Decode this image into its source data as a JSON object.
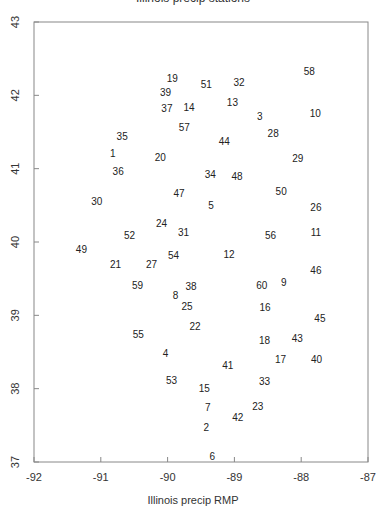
{
  "chart_data": {
    "type": "scatter",
    "title": "Illinois precip stations",
    "xlabel": "Illinois precip RMP",
    "ylabel": "",
    "xlim": [
      -92,
      -87
    ],
    "ylim": [
      37,
      43
    ],
    "xticks": [
      -92,
      -91,
      -90,
      -89,
      -88,
      -87
    ],
    "yticks": [
      37,
      38,
      39,
      40,
      41,
      42,
      43
    ],
    "grid": false,
    "marker": "text-labels",
    "points": [
      {
        "label": "58",
        "x": -87.88,
        "y": 42.33
      },
      {
        "label": "19",
        "x": -89.93,
        "y": 42.23
      },
      {
        "label": "51",
        "x": -89.42,
        "y": 42.15
      },
      {
        "label": "32",
        "x": -88.93,
        "y": 42.18
      },
      {
        "label": "39",
        "x": -90.03,
        "y": 42.05
      },
      {
        "label": "13",
        "x": -89.03,
        "y": 41.91
      },
      {
        "label": "37",
        "x": -90.01,
        "y": 41.83
      },
      {
        "label": "14",
        "x": -89.68,
        "y": 41.84
      },
      {
        "label": "3",
        "x": -88.62,
        "y": 41.72
      },
      {
        "label": "10",
        "x": -87.79,
        "y": 41.76
      },
      {
        "label": "57",
        "x": -89.75,
        "y": 41.57
      },
      {
        "label": "28",
        "x": -88.42,
        "y": 41.49
      },
      {
        "label": "35",
        "x": -90.68,
        "y": 41.44
      },
      {
        "label": "44",
        "x": -89.15,
        "y": 41.38
      },
      {
        "label": "1",
        "x": -90.82,
        "y": 41.21
      },
      {
        "label": "20",
        "x": -90.11,
        "y": 41.16
      },
      {
        "label": "29",
        "x": -88.05,
        "y": 41.15
      },
      {
        "label": "36",
        "x": -90.74,
        "y": 40.97
      },
      {
        "label": "34",
        "x": -89.36,
        "y": 40.93
      },
      {
        "label": "48",
        "x": -88.96,
        "y": 40.9
      },
      {
        "label": "47",
        "x": -89.83,
        "y": 40.67
      },
      {
        "label": "50",
        "x": -88.3,
        "y": 40.69
      },
      {
        "label": "30",
        "x": -91.06,
        "y": 40.56
      },
      {
        "label": "5",
        "x": -89.35,
        "y": 40.51
      },
      {
        "label": "26",
        "x": -87.78,
        "y": 40.48
      },
      {
        "label": "24",
        "x": -90.09,
        "y": 40.26
      },
      {
        "label": "31",
        "x": -89.76,
        "y": 40.14
      },
      {
        "label": "52",
        "x": -90.57,
        "y": 40.1
      },
      {
        "label": "56",
        "x": -88.46,
        "y": 40.1
      },
      {
        "label": "11",
        "x": -87.78,
        "y": 40.13
      },
      {
        "label": "49",
        "x": -91.29,
        "y": 39.91
      },
      {
        "label": "12",
        "x": -89.08,
        "y": 39.84
      },
      {
        "label": "54",
        "x": -89.91,
        "y": 39.82
      },
      {
        "label": "21",
        "x": -90.78,
        "y": 39.7
      },
      {
        "label": "27",
        "x": -90.24,
        "y": 39.7
      },
      {
        "label": "46",
        "x": -87.78,
        "y": 39.62
      },
      {
        "label": "59",
        "x": -90.45,
        "y": 39.42
      },
      {
        "label": "60",
        "x": -88.59,
        "y": 39.41
      },
      {
        "label": "9",
        "x": -88.26,
        "y": 39.46
      },
      {
        "label": "38",
        "x": -89.65,
        "y": 39.4
      },
      {
        "label": "8",
        "x": -89.88,
        "y": 39.28
      },
      {
        "label": "25",
        "x": -89.71,
        "y": 39.13
      },
      {
        "label": "16",
        "x": -88.54,
        "y": 39.11
      },
      {
        "label": "45",
        "x": -87.72,
        "y": 38.97
      },
      {
        "label": "22",
        "x": -89.59,
        "y": 38.85
      },
      {
        "label": "55",
        "x": -90.44,
        "y": 38.74
      },
      {
        "label": "18",
        "x": -88.55,
        "y": 38.67
      },
      {
        "label": "43",
        "x": -88.06,
        "y": 38.69
      },
      {
        "label": "4",
        "x": -90.03,
        "y": 38.49
      },
      {
        "label": "17",
        "x": -88.31,
        "y": 38.4
      },
      {
        "label": "40",
        "x": -87.77,
        "y": 38.41
      },
      {
        "label": "41",
        "x": -89.1,
        "y": 38.32
      },
      {
        "label": "53",
        "x": -89.94,
        "y": 38.12
      },
      {
        "label": "33",
        "x": -88.55,
        "y": 38.11
      },
      {
        "label": "15",
        "x": -89.45,
        "y": 38.01
      },
      {
        "label": "7",
        "x": -89.4,
        "y": 37.75
      },
      {
        "label": "23",
        "x": -88.65,
        "y": 37.76
      },
      {
        "label": "42",
        "x": -88.95,
        "y": 37.61
      },
      {
        "label": "2",
        "x": -89.42,
        "y": 37.48
      },
      {
        "label": "6",
        "x": -89.33,
        "y": 37.08
      }
    ]
  },
  "layout": {
    "plot_left": 34,
    "plot_right": 368,
    "plot_top": 22,
    "plot_bottom": 462
  }
}
